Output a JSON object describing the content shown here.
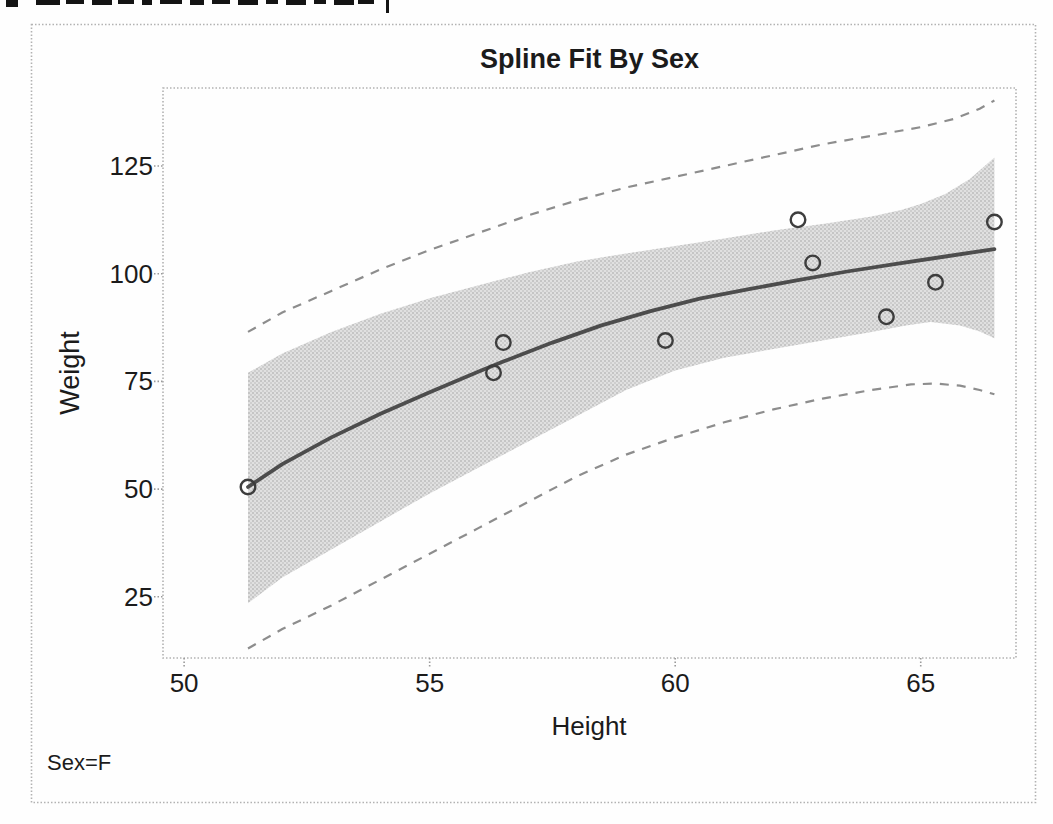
{
  "chart_data": {
    "type": "scatter",
    "title": "Spline Fit By Sex",
    "xlabel": "Height",
    "ylabel": "Weight",
    "annotation": "Sex=F",
    "x_ticks": [
      50,
      55,
      60,
      65
    ],
    "y_ticks": [
      25,
      50,
      75,
      100,
      125
    ],
    "xlim": [
      49.57,
      66.94
    ],
    "ylim": [
      10.8,
      143.1
    ],
    "grid": false,
    "legend": false,
    "series": [
      {
        "name": "observations",
        "type": "scatter",
        "marker": "open-circle",
        "points": [
          [
            51.3,
            50.5
          ],
          [
            56.3,
            77
          ],
          [
            56.5,
            84
          ],
          [
            59.8,
            84.5
          ],
          [
            62.5,
            112.5
          ],
          [
            62.8,
            102.5
          ],
          [
            64.3,
            90
          ],
          [
            65.3,
            98
          ],
          [
            66.5,
            112
          ]
        ]
      },
      {
        "name": "spline-fit",
        "type": "line",
        "points": [
          [
            51.3,
            50.5
          ],
          [
            52,
            55.8
          ],
          [
            53,
            62
          ],
          [
            54,
            67.5
          ],
          [
            55,
            72.5
          ],
          [
            56,
            77.3
          ],
          [
            56.5,
            79.6
          ],
          [
            57.5,
            84
          ],
          [
            58.5,
            88
          ],
          [
            59.5,
            91.3
          ],
          [
            60.5,
            94.2
          ],
          [
            61.5,
            96.4
          ],
          [
            62.5,
            98.5
          ],
          [
            63.5,
            100.5
          ],
          [
            64.5,
            102.3
          ],
          [
            65.5,
            104
          ],
          [
            66.5,
            105.7
          ]
        ]
      },
      {
        "name": "mean-confidence-band",
        "type": "band",
        "upper": [
          [
            51.3,
            77
          ],
          [
            52,
            81.5
          ],
          [
            53,
            86.5
          ],
          [
            54,
            90.7
          ],
          [
            55,
            94.3
          ],
          [
            56,
            97.3
          ],
          [
            57,
            100.3
          ],
          [
            58,
            102.8
          ],
          [
            59,
            104.7
          ],
          [
            60,
            106.4
          ],
          [
            61,
            108.2
          ],
          [
            62,
            110
          ],
          [
            63,
            111.5
          ],
          [
            64,
            113.3
          ],
          [
            64.6,
            114.8
          ],
          [
            65,
            116.2
          ],
          [
            65.5,
            118.5
          ],
          [
            66,
            122
          ],
          [
            66.5,
            127
          ]
        ],
        "lower": [
          [
            51.3,
            23.5
          ],
          [
            52,
            29.5
          ],
          [
            53,
            36
          ],
          [
            54,
            42.5
          ],
          [
            55,
            49
          ],
          [
            56,
            55
          ],
          [
            57,
            61
          ],
          [
            58,
            67
          ],
          [
            59,
            73
          ],
          [
            60,
            77.5
          ],
          [
            61,
            80.5
          ],
          [
            62,
            82.5
          ],
          [
            63,
            84.5
          ],
          [
            64,
            86.5
          ],
          [
            64.7,
            88
          ],
          [
            65.2,
            88.8
          ],
          [
            65.8,
            88
          ],
          [
            66.2,
            86.6
          ],
          [
            66.5,
            85
          ]
        ]
      },
      {
        "name": "prediction-limit-upper",
        "type": "dashed-line",
        "points": [
          [
            51.3,
            86.5
          ],
          [
            52,
            91
          ],
          [
            53,
            96
          ],
          [
            54,
            101
          ],
          [
            55,
            105.5
          ],
          [
            56,
            109.5
          ],
          [
            57,
            113.5
          ],
          [
            58,
            117
          ],
          [
            59,
            120
          ],
          [
            60,
            122.5
          ],
          [
            61,
            125
          ],
          [
            62,
            127.5
          ],
          [
            63,
            130
          ],
          [
            64,
            132
          ],
          [
            65,
            134
          ],
          [
            65.7,
            136
          ],
          [
            66.2,
            138.3
          ],
          [
            66.5,
            140.2
          ]
        ]
      },
      {
        "name": "prediction-limit-lower",
        "type": "dashed-line",
        "points": [
          [
            51.3,
            13
          ],
          [
            52,
            17.5
          ],
          [
            53,
            23
          ],
          [
            54,
            29
          ],
          [
            55,
            35
          ],
          [
            56,
            41
          ],
          [
            57,
            47
          ],
          [
            58,
            53
          ],
          [
            59,
            58
          ],
          [
            60,
            62
          ],
          [
            61,
            65.5
          ],
          [
            62,
            68.5
          ],
          [
            63,
            71
          ],
          [
            64,
            73
          ],
          [
            64.8,
            74.3
          ],
          [
            65.3,
            74.5
          ],
          [
            65.8,
            74
          ],
          [
            66.2,
            73
          ],
          [
            66.5,
            72
          ]
        ]
      }
    ],
    "colors": {
      "fit_line": "#4d4d4d",
      "band_base": "#e0e0e0",
      "band_dots": "#bcbcbc",
      "dashed": "#8d8d8d",
      "marker": "#3d3d3d",
      "frame": "#b2b2b2",
      "tick": "#9a9a9a",
      "text": "#1b1b1b"
    }
  }
}
